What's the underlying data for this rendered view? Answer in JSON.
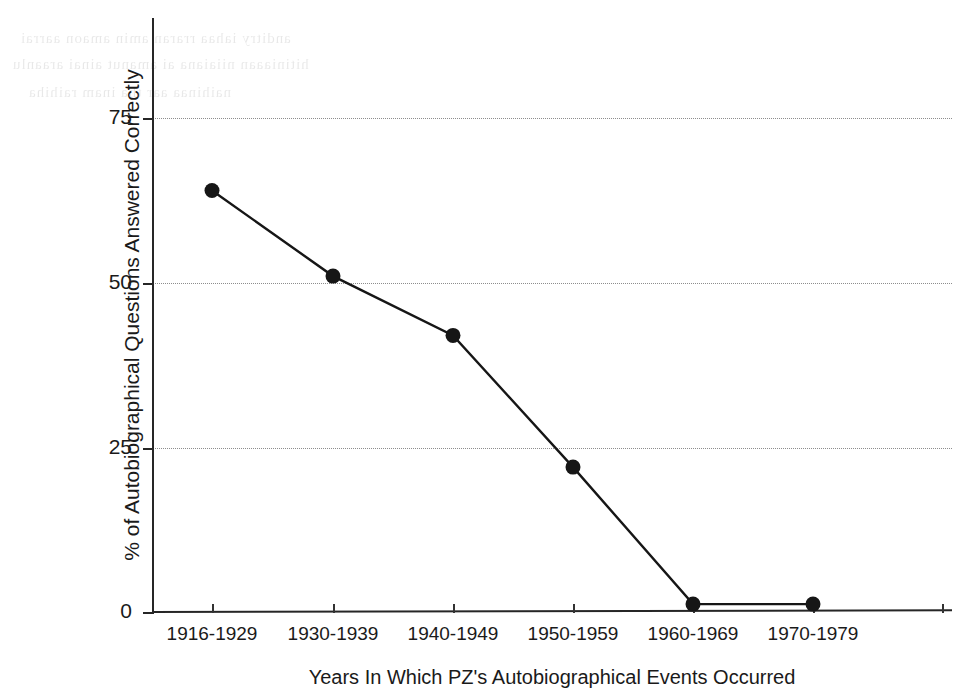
{
  "chart_data": {
    "type": "line",
    "title": "",
    "subtitle": "",
    "xlabel": "Years In Which PZ's Autobiographical Events Occurred",
    "ylabel": "% of Autobiographical Questions Answered Correctly",
    "categories": [
      "1916-1929",
      "1930-1939",
      "1940-1949",
      "1950-1959",
      "1960-1969",
      "1970-1979"
    ],
    "values": [
      64,
      51,
      42,
      22,
      1.2,
      1.2
    ],
    "series": [
      {
        "name": "% of Autobiographical Questions Answered Correctly",
        "values": [
          64,
          51,
          42,
          22,
          1.2,
          1.2
        ]
      }
    ],
    "ylim": [
      0,
      78
    ],
    "yticks": [
      0,
      25,
      50,
      75
    ],
    "ytick_labels": [
      "0",
      "25",
      "50",
      "75"
    ],
    "grid": "horizontal-dotted",
    "legend": "none",
    "marker": "filled-circle",
    "line_color": "#161616",
    "marker_color": "#161616",
    "grid_color": "#8d8d8d",
    "axis_color": "#262626",
    "background": "#ffffff"
  },
  "artifacts": {
    "note": "scan bleed-through ghost text",
    "ghost_lines": [
      "anditry  iahaa  rraran  amin  amaon aarrai",
      "hitiniaaan  niiaiana  ai  amanut  ainai araanlu",
      "naihinaa  aar tha  inam  raihiha"
    ]
  }
}
